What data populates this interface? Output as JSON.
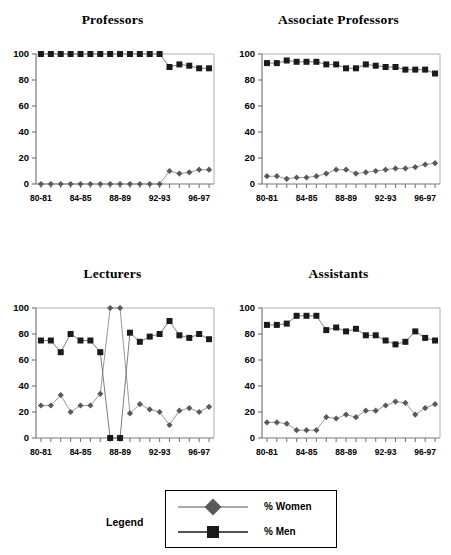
{
  "chart_data": [
    {
      "type": "line",
      "title": "Professors",
      "xlabel": "",
      "ylabel": "",
      "ylim": [
        0,
        100
      ],
      "yticks": [
        0,
        20,
        40,
        60,
        80,
        100
      ],
      "grid": false,
      "legend_position": "bottom-shared",
      "categories": [
        "80-81",
        "81-82",
        "82-83",
        "83-84",
        "84-85",
        "85-86",
        "86-87",
        "87-88",
        "88-89",
        "89-90",
        "90-91",
        "91-92",
        "92-93",
        "93-94",
        "94-95",
        "95-96",
        "96-97",
        "97-98"
      ],
      "xtick_labels": [
        "80-81",
        "84-85",
        "88-89",
        "92-93",
        "96-97"
      ],
      "series": [
        {
          "name": "% Women",
          "values": [
            0,
            0,
            0,
            0,
            0,
            0,
            0,
            0,
            0,
            0,
            0,
            0,
            0,
            10,
            8,
            9,
            11,
            11
          ]
        },
        {
          "name": "% Men",
          "values": [
            100,
            100,
            100,
            100,
            100,
            100,
            100,
            100,
            100,
            100,
            100,
            100,
            100,
            90,
            92,
            91,
            89,
            89
          ]
        }
      ]
    },
    {
      "type": "line",
      "title": "Associate Professors",
      "xlabel": "",
      "ylabel": "",
      "ylim": [
        0,
        100
      ],
      "yticks": [
        0,
        20,
        40,
        60,
        80,
        100
      ],
      "grid": false,
      "legend_position": "bottom-shared",
      "categories": [
        "80-81",
        "81-82",
        "82-83",
        "83-84",
        "84-85",
        "85-86",
        "86-87",
        "87-88",
        "88-89",
        "89-90",
        "90-91",
        "91-92",
        "92-93",
        "93-94",
        "94-95",
        "95-96",
        "96-97",
        "97-98"
      ],
      "xtick_labels": [
        "80-81",
        "84-85",
        "88-89",
        "92-93",
        "96-97"
      ],
      "series": [
        {
          "name": "% Women",
          "values": [
            6,
            6,
            4,
            5,
            5,
            6,
            8,
            11,
            11,
            8,
            9,
            10,
            11,
            12,
            12,
            13,
            15,
            16
          ]
        },
        {
          "name": "% Men",
          "values": [
            93,
            93,
            95,
            94,
            94,
            94,
            92,
            92,
            89,
            89,
            92,
            91,
            90,
            90,
            88,
            88,
            88,
            85
          ]
        }
      ]
    },
    {
      "type": "line",
      "title": "Lecturers",
      "xlabel": "",
      "ylabel": "",
      "ylim": [
        0,
        100
      ],
      "yticks": [
        0,
        20,
        40,
        60,
        80,
        100
      ],
      "grid": false,
      "legend_position": "bottom-shared",
      "categories": [
        "80-81",
        "81-82",
        "82-83",
        "83-84",
        "84-85",
        "85-86",
        "86-87",
        "87-88",
        "88-89",
        "89-90",
        "90-91",
        "91-92",
        "92-93",
        "93-94",
        "94-95",
        "95-96",
        "96-97",
        "97-98"
      ],
      "xtick_labels": [
        "80-81",
        "84-85",
        "88-89",
        "92-93",
        "96-97"
      ],
      "series": [
        {
          "name": "% Women",
          "values": [
            25,
            25,
            33,
            20,
            25,
            25,
            34,
            100,
            100,
            19,
            26,
            22,
            20,
            10,
            21,
            23,
            20,
            24
          ]
        },
        {
          "name": "% Men",
          "values": [
            75,
            75,
            66,
            80,
            75,
            75,
            66,
            0,
            0,
            81,
            74,
            78,
            80,
            90,
            79,
            77,
            80,
            76
          ]
        }
      ]
    },
    {
      "type": "line",
      "title": "Assistants",
      "xlabel": "",
      "ylabel": "",
      "ylim": [
        0,
        100
      ],
      "yticks": [
        0,
        20,
        40,
        60,
        80,
        100
      ],
      "grid": false,
      "legend_position": "bottom-shared",
      "categories": [
        "80-81",
        "81-82",
        "82-83",
        "83-84",
        "84-85",
        "85-86",
        "86-87",
        "87-88",
        "88-89",
        "89-90",
        "90-91",
        "91-92",
        "92-93",
        "93-94",
        "94-95",
        "95-96",
        "96-97",
        "97-98"
      ],
      "xtick_labels": [
        "80-81",
        "84-85",
        "88-89",
        "92-93",
        "96-97"
      ],
      "series": [
        {
          "name": "% Women",
          "values": [
            12,
            12,
            11,
            6,
            6,
            6,
            16,
            15,
            18,
            16,
            21,
            21,
            25,
            28,
            27,
            18,
            23,
            26
          ]
        },
        {
          "name": "% Men",
          "values": [
            87,
            87,
            88,
            94,
            94,
            94,
            83,
            85,
            82,
            84,
            79,
            79,
            75,
            72,
            74,
            82,
            77,
            75
          ]
        }
      ]
    }
  ],
  "panels": [
    {
      "title": "Professors"
    },
    {
      "title": "Associate Professors"
    },
    {
      "title": "Lecturers"
    },
    {
      "title": "Assistants"
    }
  ],
  "legend": {
    "caption": "Legend",
    "entries": [
      {
        "label": "% Women",
        "marker": "diamond-marker",
        "color": "#595959"
      },
      {
        "label": "% Men",
        "marker": "square-marker",
        "color": "#1a1a1a"
      }
    ]
  },
  "style": {
    "women_color": "#595959",
    "men_color": "#1a1a1a",
    "axis_color": "#808080",
    "line_color": "#8c8c8c",
    "background": "#ffffff"
  }
}
